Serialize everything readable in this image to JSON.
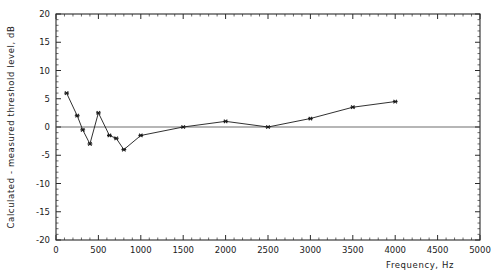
{
  "chart_data": {
    "type": "line",
    "title": "",
    "xlabel": "Frequency, Hz",
    "ylabel": "Calculated - measured threshold level, dB",
    "xlim": [
      0,
      5000
    ],
    "ylim": [
      -20,
      20
    ],
    "xticks": [
      0,
      500,
      1000,
      1500,
      2000,
      2500,
      3000,
      3500,
      4000,
      4500,
      5000
    ],
    "xtick_labels": [
      "0",
      "500",
      "1000",
      "1500",
      "2000",
      "2500",
      "3000",
      "3500",
      "4000",
      "4500",
      "5000"
    ],
    "yticks": [
      -20,
      -15,
      -10,
      -5,
      0,
      5,
      10,
      15,
      20
    ],
    "ytick_labels": [
      "-20",
      "-15",
      "-10",
      "-5",
      "0",
      "5",
      "10",
      "15",
      "20"
    ],
    "grid": false,
    "legend": null,
    "zero_reference_line": 0,
    "marker": "asterisk",
    "series": [
      {
        "name": "Calculated minus measured threshold",
        "x": [
          125,
          250,
          315,
          400,
          500,
          630,
          710,
          800,
          1000,
          1500,
          2000,
          2500,
          3000,
          3500,
          4000
        ],
        "y": [
          6.0,
          2.0,
          -0.5,
          -3.0,
          2.5,
          -1.5,
          -2.0,
          -4.0,
          -1.5,
          0.0,
          1.0,
          0.0,
          1.5,
          3.5,
          4.5
        ]
      }
    ]
  },
  "axes": {
    "x_axis_name": "frequency-axis",
    "y_axis_name": "threshold-difference-axis"
  }
}
